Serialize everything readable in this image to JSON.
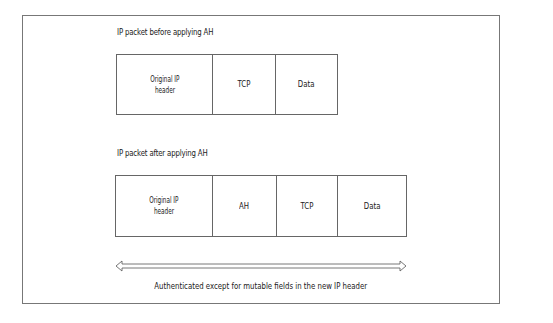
{
  "diagram": {
    "before": {
      "title": "IP packet before applying AH",
      "fields": [
        {
          "label": "Original IP\nheader",
          "line1": "Original IP",
          "line2": "header"
        },
        {
          "label": "TCP"
        },
        {
          "label": "Data"
        }
      ]
    },
    "after": {
      "title": "IP packet after applying AH",
      "fields": [
        {
          "label": "Original IP\nheader",
          "line1": "Original IP",
          "line2": "header"
        },
        {
          "label": "AH"
        },
        {
          "label": "TCP"
        },
        {
          "label": "Data"
        }
      ]
    },
    "span_arrow": {
      "type": "double-headed-hollow",
      "caption": "Authenticated except for mutable fields in the new IP header"
    },
    "colors": {
      "border": "#666666",
      "frame": "#777777",
      "text": "#1a1a1a",
      "background": "#ffffff"
    }
  }
}
